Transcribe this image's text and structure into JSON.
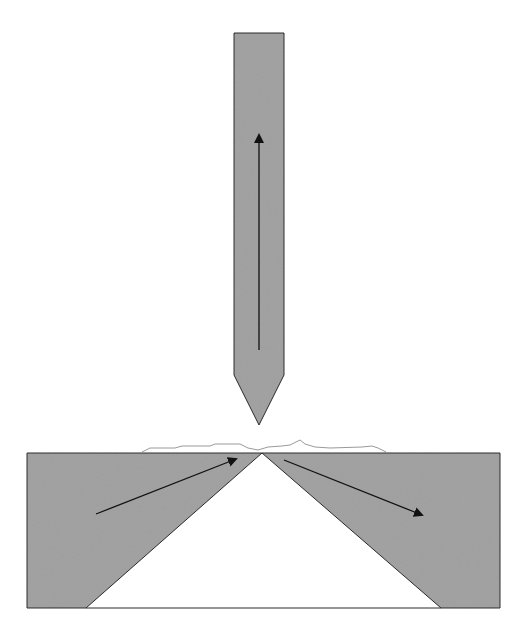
{
  "diagram": {
    "title": "",
    "colors": {
      "fill": "#a3a3a3",
      "stroke": "#2a2a2a",
      "arrow": "#111111",
      "surface_line": "#9a9a9a",
      "background": "#ffffff"
    },
    "elements": [
      {
        "id": "probe",
        "shape": "pencil",
        "direction": "down"
      },
      {
        "id": "probe-arrow",
        "direction": "up"
      },
      {
        "id": "block",
        "shape": "rectangle-with-triangular-cutout"
      },
      {
        "id": "incident-arrow",
        "direction": "up-right"
      },
      {
        "id": "reflected-arrow",
        "direction": "down-right"
      },
      {
        "id": "surface-profile",
        "shape": "wavy-line"
      }
    ]
  }
}
